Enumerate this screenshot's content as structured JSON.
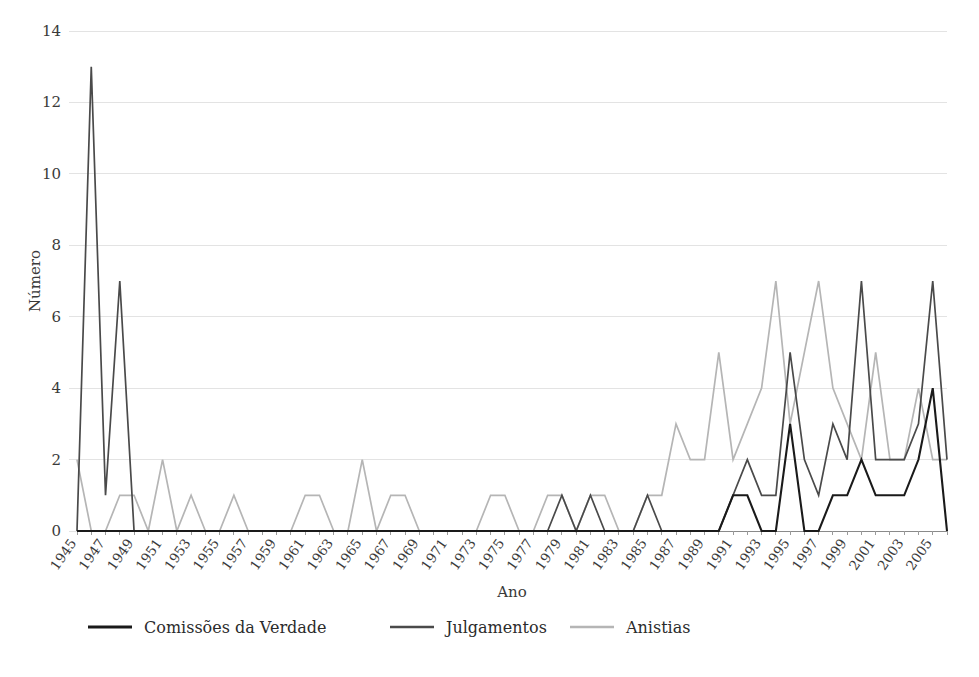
{
  "chart_data": {
    "type": "line",
    "title": "",
    "xlabel": "Ano",
    "ylabel": "Número",
    "ylim": [
      0,
      14
    ],
    "ytick_values": [
      0,
      2,
      4,
      6,
      8,
      10,
      12,
      14
    ],
    "ytick_labels": [
      "0",
      "2",
      "4",
      "6",
      "8",
      "10",
      "12",
      "14"
    ],
    "xlim": [
      1945,
      2006
    ],
    "grid": true,
    "grid_axis": "y",
    "legend_position": "bottom",
    "x": [
      1945,
      1946,
      1947,
      1948,
      1949,
      1950,
      1951,
      1952,
      1953,
      1954,
      1955,
      1956,
      1957,
      1958,
      1959,
      1960,
      1961,
      1962,
      1963,
      1964,
      1965,
      1966,
      1967,
      1968,
      1969,
      1970,
      1971,
      1972,
      1973,
      1974,
      1975,
      1976,
      1977,
      1978,
      1979,
      1980,
      1981,
      1982,
      1983,
      1984,
      1985,
      1986,
      1987,
      1988,
      1989,
      1990,
      1991,
      1992,
      1993,
      1994,
      1995,
      1996,
      1997,
      1998,
      1999,
      2000,
      2001,
      2002,
      2003,
      2004,
      2005,
      2006
    ],
    "xtick_labels": [
      "1945",
      "1947",
      "1949",
      "1951",
      "1953",
      "1955",
      "1957",
      "1959",
      "1961",
      "1963",
      "1965",
      "1967",
      "1969",
      "1971",
      "1973",
      "1975",
      "1977",
      "1979",
      "1981",
      "1983",
      "1985",
      "1987",
      "1989",
      "1991",
      "1993",
      "1995",
      "1997",
      "1999",
      "2001",
      "2003",
      "2005"
    ],
    "xtick_values": [
      1945,
      1947,
      1949,
      1951,
      1953,
      1955,
      1957,
      1959,
      1961,
      1963,
      1965,
      1967,
      1969,
      1971,
      1973,
      1975,
      1977,
      1979,
      1981,
      1983,
      1985,
      1987,
      1989,
      1991,
      1993,
      1995,
      1997,
      1999,
      2001,
      2003,
      2005
    ],
    "series": [
      {
        "name": "Comissões da Verdade",
        "color": "#1a1a1a",
        "width": 2.1,
        "values": [
          0,
          0,
          0,
          0,
          0,
          0,
          0,
          0,
          0,
          0,
          0,
          0,
          0,
          0,
          0,
          0,
          0,
          0,
          0,
          0,
          0,
          0,
          0,
          0,
          0,
          0,
          0,
          0,
          0,
          0,
          0,
          0,
          0,
          0,
          0,
          0,
          0,
          0,
          0,
          0,
          0,
          0,
          0,
          0,
          0,
          0,
          1,
          1,
          0,
          0,
          3,
          0,
          0,
          1,
          1,
          2,
          1,
          1,
          1,
          2,
          4,
          0
        ]
      },
      {
        "name": "Julgamentos",
        "color": "#4a4a4a",
        "width": 1.7,
        "values": [
          0,
          13,
          1,
          7,
          0,
          0,
          0,
          0,
          0,
          0,
          0,
          0,
          0,
          0,
          0,
          0,
          0,
          0,
          0,
          0,
          0,
          0,
          0,
          0,
          0,
          0,
          0,
          0,
          0,
          0,
          0,
          0,
          0,
          0,
          1,
          0,
          1,
          0,
          0,
          0,
          1,
          0,
          0,
          0,
          0,
          0,
          1,
          2,
          1,
          1,
          5,
          2,
          1,
          3,
          2,
          7,
          2,
          2,
          2,
          3,
          7,
          2
        ]
      },
      {
        "name": "Anistias",
        "color": "#b5b5b5",
        "width": 1.7,
        "values": [
          2,
          0,
          0,
          1,
          1,
          0,
          2,
          0,
          1,
          0,
          0,
          1,
          0,
          0,
          0,
          0,
          1,
          1,
          0,
          0,
          2,
          0,
          1,
          1,
          0,
          0,
          0,
          0,
          0,
          1,
          1,
          0,
          0,
          1,
          1,
          0,
          1,
          1,
          0,
          0,
          1,
          1,
          3,
          2,
          2,
          5,
          2,
          3,
          4,
          7,
          3,
          5,
          7,
          4,
          3,
          2,
          5,
          2,
          2,
          4,
          2,
          2
        ]
      }
    ]
  },
  "legend": {
    "items": [
      {
        "label": "Comissões da Verdade",
        "color": "#1a1a1a"
      },
      {
        "label": "Julgamentos",
        "color": "#4a4a4a"
      },
      {
        "label": "Anistias",
        "color": "#b5b5b5"
      }
    ]
  }
}
